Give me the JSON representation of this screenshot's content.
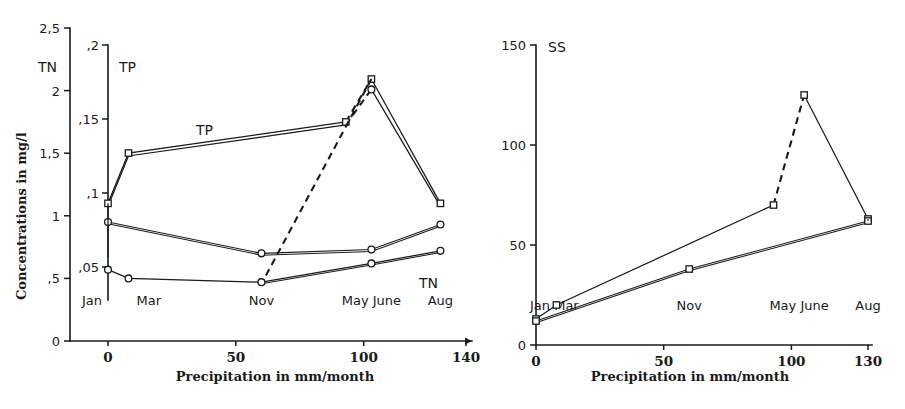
{
  "figure": {
    "title": "",
    "panels": [
      "left",
      "right"
    ]
  },
  "left": {
    "y_axis_title": "Concentrations in  mg/l",
    "x_axis_title": "Precipitation in  mm/month",
    "primary_axis_name": "TN",
    "secondary_axis_name": "TP",
    "tn_ticks": [
      "2,5",
      "2",
      "1,5",
      "1",
      ",5",
      "0"
    ],
    "tp_ticks": [
      ",2",
      ",15",
      ",1",
      ",05"
    ],
    "x_ticks": [
      "0",
      "50",
      "100",
      "140"
    ],
    "month_labels": [
      "Jan",
      "Mar",
      "Nov",
      "May June",
      "Aug"
    ],
    "curve_label_tp": "TP",
    "curve_label_tn": "TN",
    "x_origin_tick": "0",
    "y_zero_tick": "0"
  },
  "right": {
    "axis_name": "SS",
    "x_axis_title": "Precipitation in  mm/month",
    "y_ticks": [
      "150",
      "100",
      "50",
      "0"
    ],
    "x_ticks": [
      "0",
      "50",
      "100",
      "130"
    ],
    "month_labels": [
      "Jan Mar",
      "Nov",
      "May June",
      "Aug"
    ]
  },
  "chart_data": [
    {
      "type": "line",
      "panel": "left",
      "title": "",
      "xlabel": "Precipitation in  mm/month",
      "ylabel": "Concentrations in  mg/l",
      "xlim": [
        0,
        140
      ],
      "xticks": [
        0,
        50,
        100,
        140
      ],
      "grid": false,
      "legend": "inline-labels",
      "axes": [
        {
          "name": "TN",
          "ylim": [
            0,
            2.5
          ],
          "yticks": [
            0,
            0.5,
            1,
            1.5,
            2,
            2.5
          ],
          "yticklabels": [
            "0",
            ",5",
            "1",
            "1,5",
            "2",
            "2,5"
          ]
        },
        {
          "name": "TP",
          "ylim": [
            0,
            0.2
          ],
          "yticks": [
            0.05,
            0.1,
            0.15,
            0.2
          ],
          "yticklabels": [
            ",05",
            ",1",
            ",15",
            ",2"
          ]
        }
      ],
      "month_markers": [
        {
          "label": "Jan",
          "x": 0
        },
        {
          "label": "Mar",
          "x": 8
        },
        {
          "label": "Nov",
          "x": 60
        },
        {
          "label": "May June",
          "x": 103
        },
        {
          "label": "Aug",
          "x": 130
        }
      ],
      "series": [
        {
          "name": "TP",
          "axis": "TP",
          "marker": "square",
          "style": "double-line",
          "x": [
            0,
            8,
            93,
            103,
            130
          ],
          "values": [
            0.093,
            0.127,
            0.148,
            0.177,
            0.093
          ],
          "dashed_segments": [
            [
              93,
              0.148,
              103,
              0.177
            ]
          ]
        },
        {
          "name": "TP-second",
          "axis": "TP",
          "marker": "square",
          "style": "double-line",
          "x": [
            0,
            8,
            93,
            103,
            130
          ],
          "values": [
            0.091,
            0.125,
            0.146,
            0.17,
            0.091
          ]
        },
        {
          "name": "TN-upper",
          "axis": "TN",
          "marker": "circle",
          "x": [
            0,
            60,
            103,
            130
          ],
          "values": [
            0.95,
            0.7,
            0.73,
            0.93
          ]
        },
        {
          "name": "TN",
          "axis": "TN",
          "marker": "circle",
          "x": [
            0,
            8,
            60,
            103,
            130
          ],
          "values": [
            0.57,
            0.5,
            0.47,
            0.62,
            0.72
          ]
        }
      ]
    },
    {
      "type": "line",
      "panel": "right",
      "title": "SS",
      "xlabel": "Precipitation in  mm/month",
      "ylabel": "SS",
      "xlim": [
        0,
        130
      ],
      "ylim": [
        0,
        150
      ],
      "xticks": [
        0,
        50,
        100,
        130
      ],
      "yticks": [
        0,
        50,
        100,
        150
      ],
      "grid": false,
      "month_markers": [
        {
          "label": "Jan Mar",
          "x": 0
        },
        {
          "label": "Nov",
          "x": 60
        },
        {
          "label": "May June",
          "x": 103
        },
        {
          "label": "Aug",
          "x": 130
        }
      ],
      "series": [
        {
          "name": "SS-upper",
          "marker": "square",
          "x": [
            0,
            8,
            93,
            105,
            130
          ],
          "values": [
            13,
            20,
            70,
            125,
            63
          ],
          "dashed_segments": [
            [
              93,
              70,
              105,
              125
            ]
          ]
        },
        {
          "name": "SS-lower",
          "marker": "square",
          "x": [
            0,
            60,
            130
          ],
          "values": [
            12,
            38,
            62
          ]
        }
      ]
    }
  ]
}
